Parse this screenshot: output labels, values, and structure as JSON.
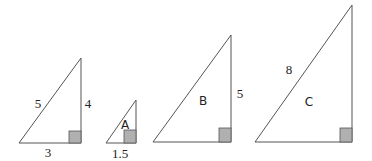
{
  "diagram": {
    "colors": {
      "stroke": "#555555",
      "right_angle_fill": "#b0b0b0",
      "text": "#222222"
    },
    "triangles": [
      {
        "id": "original",
        "name": "",
        "hypotenuse": "5",
        "height": "4",
        "base": "3",
        "points": "19,143 81,143 81,58",
        "square": [
          69,
          131,
          12,
          12
        ],
        "labels": {
          "hypotenuse": {
            "x": 38,
            "y": 103
          },
          "height": {
            "x": 88,
            "y": 103
          },
          "base": {
            "x": 48,
            "y": 152
          }
        }
      },
      {
        "id": "A",
        "name": "A",
        "hypotenuse": "",
        "height": "",
        "base": "1.5",
        "points": "106,143 136,143 136,100",
        "square": [
          124,
          130,
          12,
          13
        ],
        "labels": {
          "name": {
            "x": 125,
            "y": 125
          },
          "base": {
            "x": 120,
            "y": 153
          }
        }
      },
      {
        "id": "B",
        "name": "B",
        "hypotenuse": "",
        "height": "5",
        "base": "",
        "points": "153,142 231,142 231,35",
        "square": [
          219,
          128,
          12,
          14
        ],
        "labels": {
          "name": {
            "x": 203,
            "y": 101
          },
          "height": {
            "x": 240,
            "y": 93
          }
        }
      },
      {
        "id": "C",
        "name": "C",
        "hypotenuse": "8",
        "height": "",
        "base": "",
        "points": "255,142 352,142 352,5",
        "square": [
          340,
          128,
          12,
          14
        ],
        "labels": {
          "name": {
            "x": 309,
            "y": 102
          },
          "hypotenuse": {
            "x": 289,
            "y": 69
          }
        }
      }
    ]
  }
}
